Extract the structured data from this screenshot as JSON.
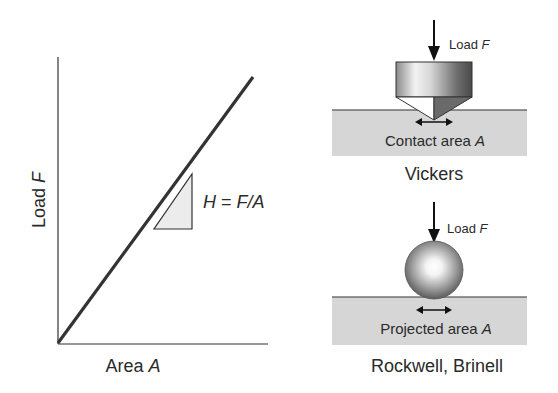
{
  "graph": {
    "y_label": "Load",
    "y_label_var": "F",
    "x_label": "Area",
    "x_label_var": "A",
    "slope_label": {
      "lhs": "H",
      "eq": " = ",
      "rhs": "F/A"
    }
  },
  "vickers": {
    "load_label": "Load",
    "load_var": "F",
    "area_label": "Contact area",
    "area_var": "A",
    "title": "Vickers"
  },
  "brinell": {
    "load_label": "Load",
    "load_var": "F",
    "area_label": "Projected area",
    "area_var": "A",
    "title": "Rockwell, Brinell"
  },
  "colors": {
    "line": "#333333",
    "surface": "#d6d6d6",
    "triangle_fill": "#ececec",
    "text": "#2a2a2a"
  }
}
